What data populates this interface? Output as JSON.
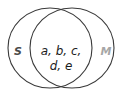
{
  "figure": {
    "type": "venn-diagram",
    "background_color": "#ffffff",
    "stroke_color": "#3a3a3a",
    "sets": [
      {
        "key": "left",
        "label": "S",
        "label_color": "#4a4a4a",
        "cx": 50,
        "cy": 48,
        "rx": 42,
        "ry": 40,
        "label_x": 18,
        "label_y": 52
      },
      {
        "key": "right",
        "label": "M",
        "label_color": "#a6a6a6",
        "cx": 72,
        "cy": 48,
        "rx": 42,
        "ry": 40,
        "label_x": 106,
        "label_y": 52
      }
    ],
    "intersection": {
      "lines": [
        "a, b, c,",
        "d, e"
      ],
      "text_color": "#1c1c1c",
      "center_x": 61,
      "line1_y": 55,
      "line2_y": 70
    }
  }
}
